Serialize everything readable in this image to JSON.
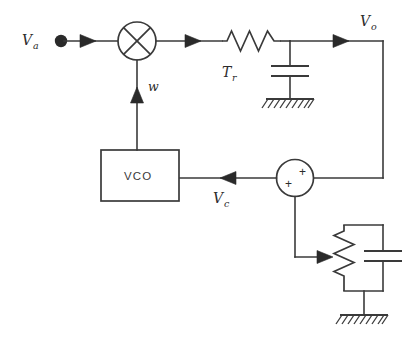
{
  "diagram": {
    "background_color": "#ffffff",
    "line_color": "#3a3a3a",
    "labels": {
      "input_signal": "V",
      "input_signal_sub": "a",
      "output_signal": "V",
      "output_signal_sub": "o",
      "control_signal": "V",
      "control_signal_sub": "c",
      "vco_block": "VCO",
      "mixer_feedback": "w",
      "time_constant": "T",
      "time_constant_sub": "r",
      "summer_plus_top": "+",
      "summer_plus_bottom": "+"
    },
    "components": [
      {
        "name": "input-terminal",
        "type": "terminal-dot",
        "label": "Va"
      },
      {
        "name": "mixer",
        "type": "multiplier-circle-x",
        "label": ""
      },
      {
        "name": "lowpass-resistor",
        "type": "resistor-zigzag",
        "label": "Tr"
      },
      {
        "name": "lowpass-capacitor",
        "type": "capacitor",
        "label": ""
      },
      {
        "name": "lowpass-ground",
        "type": "ground-hatched",
        "label": ""
      },
      {
        "name": "vco",
        "type": "block-rectangle",
        "label": "VCO"
      },
      {
        "name": "summing-junction",
        "type": "summer-circle",
        "label": "+ +"
      },
      {
        "name": "potentiometer",
        "type": "variable-resistor",
        "label": ""
      },
      {
        "name": "tuning-capacitor",
        "type": "capacitor",
        "label": ""
      },
      {
        "name": "tuning-ground",
        "type": "ground-hatched",
        "label": ""
      }
    ]
  }
}
